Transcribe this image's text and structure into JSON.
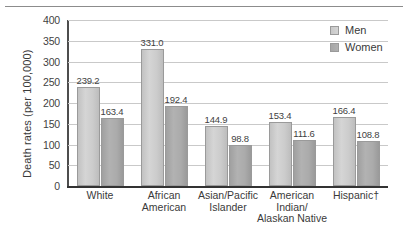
{
  "chart_data": {
    "type": "bar",
    "title": "",
    "xlabel": "",
    "ylabel": "Death rates (per 100,000)",
    "ylim": [
      0,
      400
    ],
    "yticks": [
      0,
      50,
      100,
      150,
      200,
      250,
      300,
      350,
      400
    ],
    "grid": true,
    "legend_position": "top-right",
    "categories": [
      "White",
      "African\nAmerican",
      "Asian/Pacific\nIslander",
      "American\nIndian/\nAlaskan Native",
      "Hispanic†"
    ],
    "series": [
      {
        "name": "Men",
        "values": [
          239.2,
          331.0,
          144.9,
          153.4,
          166.4
        ],
        "color": "#cccccc"
      },
      {
        "name": "Women",
        "values": [
          163.4,
          192.4,
          98.8,
          111.6,
          108.8
        ],
        "color": "#a8a8a8"
      }
    ],
    "value_labels": {
      "men": [
        "239.2",
        "331.0",
        "144.9",
        "153.4",
        "166.4"
      ],
      "women": [
        "163.4",
        "192.4",
        "98.8",
        "111.6",
        "108.8"
      ]
    },
    "tick_labels": [
      "400",
      "350",
      "300",
      "250",
      "200",
      "150",
      "100",
      "50",
      "0"
    ]
  },
  "legend": {
    "items": [
      {
        "label": "Men"
      },
      {
        "label": "Women"
      }
    ]
  }
}
